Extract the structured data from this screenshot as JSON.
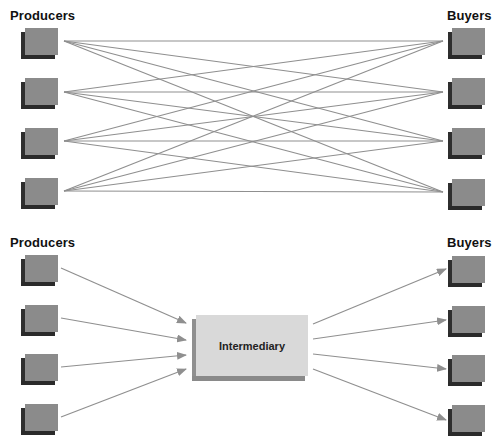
{
  "top_panel": {
    "left_label": "Producers",
    "right_label": "Buyers",
    "producers_count": 4,
    "buyers_count": 4,
    "description": "Direct exchange: every producer connected to every buyer (16 links)"
  },
  "bottom_panel": {
    "left_label": "Producers",
    "right_label": "Buyers",
    "center_label": "Intermediary",
    "producers_count": 4,
    "buyers_count": 4,
    "description": "Indirect exchange through an intermediary (8 links)"
  },
  "colors": {
    "line": "#8f8f8f",
    "node_face": "#8b8b8b",
    "node_shadow": "#2e2e2e",
    "intermediary_face": "#d9d9d9",
    "intermediary_shadow": "#8f8f8f"
  }
}
